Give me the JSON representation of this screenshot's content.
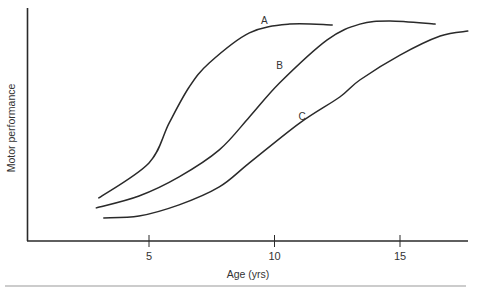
{
  "chart_data": {
    "type": "line",
    "title": "",
    "xlabel": "Age (yrs)",
    "ylabel": "Motor performance",
    "xlim": [
      0,
      17.6
    ],
    "ylim": [
      0,
      100
    ],
    "x_ticks": [
      5,
      10,
      15
    ],
    "x_tick_labels": [
      "5",
      "10",
      "15"
    ],
    "y_ticks": [],
    "grid": false,
    "legend": "inline labels",
    "series": [
      {
        "name": "A",
        "label_at": [
          9.6,
          93
        ],
        "points": [
          [
            3.0,
            18.5
          ],
          [
            5.0,
            33.5
          ],
          [
            5.8,
            50.6
          ],
          [
            6.6,
            66.1
          ],
          [
            7.4,
            76.4
          ],
          [
            9.0,
            89.3
          ],
          [
            10.6,
            93.1
          ],
          [
            12.3,
            92.7
          ]
        ]
      },
      {
        "name": "B",
        "label_at": [
          10.2,
          74
        ],
        "points": [
          [
            2.9,
            14.2
          ],
          [
            4.6,
            19.3
          ],
          [
            6.2,
            27.5
          ],
          [
            7.8,
            39.1
          ],
          [
            9.0,
            53.2
          ],
          [
            10.2,
            67.8
          ],
          [
            12.1,
            86.3
          ],
          [
            13.4,
            93.1
          ],
          [
            14.6,
            94.4
          ],
          [
            16.4,
            93.1
          ]
        ]
      },
      {
        "name": "C",
        "label_at": [
          11.1,
          52
        ],
        "points": [
          [
            3.2,
            9.9
          ],
          [
            4.6,
            10.7
          ],
          [
            6.2,
            15.5
          ],
          [
            7.8,
            23.2
          ],
          [
            9.0,
            33.5
          ],
          [
            11.0,
            50.6
          ],
          [
            12.6,
            61.8
          ],
          [
            13.4,
            69.1
          ],
          [
            15.0,
            79.8
          ],
          [
            16.6,
            88.0
          ],
          [
            17.7,
            90.1
          ]
        ]
      }
    ]
  }
}
